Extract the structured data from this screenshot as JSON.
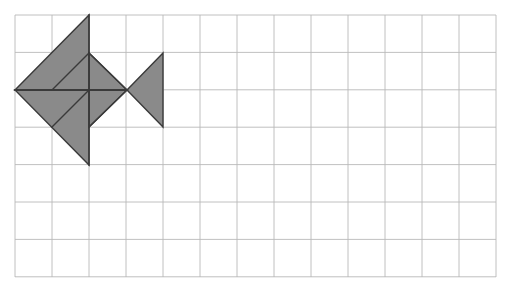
{
  "canvas": {
    "width": 505,
    "height": 296,
    "background_color": "#ffffff",
    "title": "Tangram fish figure on square grid"
  },
  "grid": {
    "name": "square-grid",
    "origin_x": 15,
    "origin_y": 15,
    "cell_width": 37,
    "cell_height": 37.4,
    "columns": 13,
    "rows": 7,
    "right_edge": 496,
    "bottom_edge": 277,
    "line_color": "#b9b9b9",
    "line_width": 0.9,
    "border_color": "#b0b0b0"
  },
  "figure": {
    "name": "tangram-fish",
    "fill_color": "#8a8a8a",
    "stroke_color": "#3a3a3a",
    "stroke_width": 1.4,
    "pieces": [
      {
        "name": "large-triangle-upper",
        "label": "Large triangle (upper head)",
        "points": "15,90 89,15 89,90"
      },
      {
        "name": "large-triangle-lower",
        "label": "Large triangle (lower head)",
        "points": "15,90 89,90 89,165"
      },
      {
        "name": "medium-triangle-upper-right",
        "label": "Medium triangle (upper body)",
        "points": "89,53 127,90 89,90"
      },
      {
        "name": "medium-triangle-lower-right",
        "label": "Medium triangle (lower body)",
        "points": "89,90 127,90 89,127"
      },
      {
        "name": "tail-triangle",
        "label": "Tail triangle",
        "points": "127,90 163,53 163,127"
      }
    ],
    "inner_lines": [
      {
        "name": "inner-diagonal-upper",
        "x1": 52,
        "y1": 90,
        "x2": 89,
        "y2": 53
      },
      {
        "name": "inner-diagonal-lower",
        "x1": 52,
        "y1": 127,
        "x2": 89,
        "y2": 90
      },
      {
        "name": "inner-vertical-spine",
        "x1": 89,
        "y1": 15,
        "x2": 89,
        "y2": 165
      },
      {
        "name": "inner-horizontal-midline",
        "x1": 15,
        "y1": 90,
        "x2": 127,
        "y2": 90
      },
      {
        "name": "inner-edge-upper-right",
        "x1": 89,
        "y1": 53,
        "x2": 127,
        "y2": 90
      },
      {
        "name": "inner-edge-lower-right",
        "x1": 89,
        "y1": 127,
        "x2": 127,
        "y2": 90
      }
    ]
  },
  "chart_data": {
    "type": "scatter",
    "xlabel": "",
    "ylabel": "",
    "grid": true,
    "legend": "none",
    "xlim": [
      0,
      13
    ],
    "ylim": [
      0,
      7
    ],
    "categories": [
      "large-triangle-upper",
      "large-triangle-lower",
      "medium-triangle-upper-right",
      "medium-triangle-lower-right",
      "tail-triangle"
    ],
    "values": [
      2,
      2,
      0.5,
      0.5,
      1
    ],
    "annotations": [
      "Fish head points left at grid row 2 boundary",
      "Body spans grid columns 0 through 3",
      "Tail spans grid columns 3 through 4"
    ]
  }
}
